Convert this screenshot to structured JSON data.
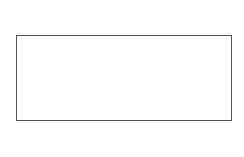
{
  "diagram": {
    "title": "",
    "top_label": "σ",
    "bottom_label": "σ",
    "plate": {
      "x": 16,
      "y": 35,
      "width": 215,
      "height": 85,
      "stroke": "#555555"
    },
    "arrows_x": [
      56,
      85,
      113,
      141,
      169,
      198
    ],
    "cracks": {
      "y": 77,
      "x": [
        48,
        73,
        98,
        124,
        149,
        174,
        200
      ]
    },
    "colors": {
      "line": "#555555",
      "arrow": "#333333"
    }
  }
}
